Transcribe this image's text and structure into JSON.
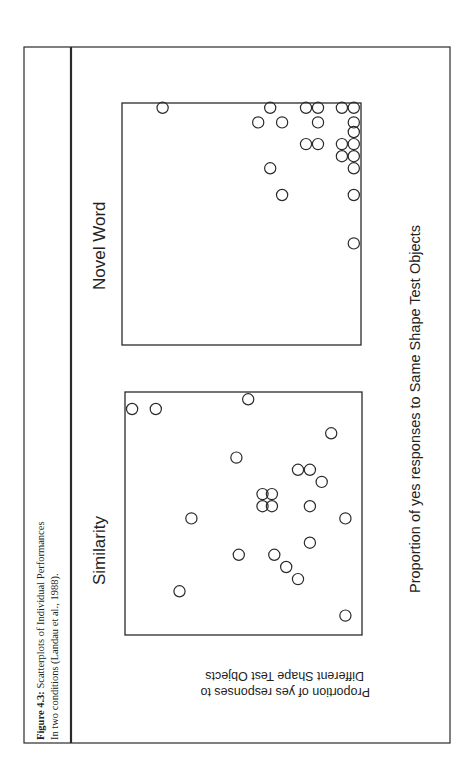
{
  "figure": {
    "caption_label": "Figure 4.3:",
    "caption_title": " Scatterplots of Individual Performances",
    "caption_subtitle": "In two conditions (Landau et al., 1988).",
    "orientation": "rotated 90° counter-clockwise",
    "colors": {
      "frame": "#2a2a2a",
      "marker": "#2a2a2a",
      "background": "#ffffff"
    }
  },
  "chart_data": [
    {
      "type": "scatter",
      "title": "Similarity",
      "xlabel": "Proportion of yes responses to Same Shape Test Objects",
      "ylabel": "Proportion of yes responses to Different Shape Test Objects",
      "xlim": [
        0,
        1
      ],
      "ylim": [
        0,
        1
      ],
      "grid": false,
      "marker": "open-circle",
      "points": [
        {
          "x": 0.93,
          "y": 0.97
        },
        {
          "x": 0.93,
          "y": 0.87
        },
        {
          "x": 0.97,
          "y": 0.48
        },
        {
          "x": 0.83,
          "y": 0.13
        },
        {
          "x": 0.73,
          "y": 0.53
        },
        {
          "x": 0.68,
          "y": 0.27
        },
        {
          "x": 0.68,
          "y": 0.22
        },
        {
          "x": 0.63,
          "y": 0.17
        },
        {
          "x": 0.58,
          "y": 0.42
        },
        {
          "x": 0.58,
          "y": 0.38
        },
        {
          "x": 0.53,
          "y": 0.42
        },
        {
          "x": 0.53,
          "y": 0.38
        },
        {
          "x": 0.53,
          "y": 0.22
        },
        {
          "x": 0.48,
          "y": 0.72
        },
        {
          "x": 0.48,
          "y": 0.07
        },
        {
          "x": 0.38,
          "y": 0.22
        },
        {
          "x": 0.33,
          "y": 0.52
        },
        {
          "x": 0.33,
          "y": 0.37
        },
        {
          "x": 0.28,
          "y": 0.32
        },
        {
          "x": 0.23,
          "y": 0.27
        },
        {
          "x": 0.18,
          "y": 0.77
        },
        {
          "x": 0.08,
          "y": 0.07
        }
      ]
    },
    {
      "type": "scatter",
      "title": "Novel Word",
      "xlabel": "Proportion of yes responses to Same Shape Test Objects",
      "ylabel": "Proportion of yes responses to Different Shape Test Objects",
      "xlim": [
        0,
        1
      ],
      "ylim": [
        0,
        1
      ],
      "grid": false,
      "marker": "open-circle",
      "points": [
        {
          "x": 0.98,
          "y": 0.83
        },
        {
          "x": 0.98,
          "y": 0.38
        },
        {
          "x": 0.92,
          "y": 0.43
        },
        {
          "x": 0.92,
          "y": 0.33
        },
        {
          "x": 0.98,
          "y": 0.23
        },
        {
          "x": 0.98,
          "y": 0.18
        },
        {
          "x": 0.92,
          "y": 0.18
        },
        {
          "x": 0.98,
          "y": 0.08
        },
        {
          "x": 0.98,
          "y": 0.03
        },
        {
          "x": 0.92,
          "y": 0.03
        },
        {
          "x": 0.88,
          "y": 0.03
        },
        {
          "x": 0.83,
          "y": 0.23
        },
        {
          "x": 0.83,
          "y": 0.18
        },
        {
          "x": 0.83,
          "y": 0.08
        },
        {
          "x": 0.83,
          "y": 0.03
        },
        {
          "x": 0.78,
          "y": 0.08
        },
        {
          "x": 0.78,
          "y": 0.03
        },
        {
          "x": 0.73,
          "y": 0.03
        },
        {
          "x": 0.73,
          "y": 0.38
        },
        {
          "x": 0.62,
          "y": 0.33
        },
        {
          "x": 0.62,
          "y": 0.03
        },
        {
          "x": 0.42,
          "y": 0.03
        }
      ]
    }
  ],
  "axis_labels": {
    "x_label": "Proportion of yes responses to Same Shape Test Objects",
    "y_label_line1": "Proportion of yes responses to",
    "y_label_line2": "Different Shape Test Objects"
  }
}
